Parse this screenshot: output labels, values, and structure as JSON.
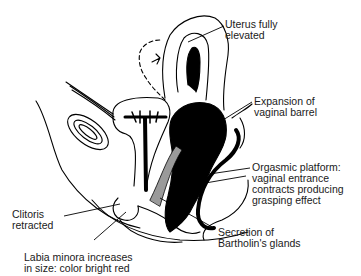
{
  "diagram": {
    "labels": {
      "uterus": "Uterus fully\nelevated",
      "vaginal_barrel": "Expansion of\nvaginal barrel",
      "orgasmic_platform": "Orgasmic platform:\nvaginal entrance\ncontracts producing\ngrasping effect",
      "clitoris": "Clitoris\nretracted",
      "labia": "Labia minora increases\nin size: color bright red",
      "bartholin": "Secretion of\nBartholin's glands"
    },
    "colors": {
      "ink": "#000000",
      "background": "#ffffff",
      "shading": "#9a9a9a"
    }
  }
}
